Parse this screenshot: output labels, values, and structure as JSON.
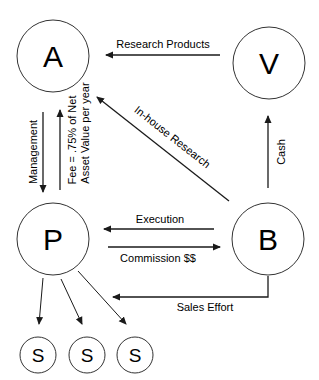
{
  "diagram": {
    "nodes": [
      {
        "id": "A",
        "label": "A"
      },
      {
        "id": "V",
        "label": "V"
      },
      {
        "id": "P",
        "label": "P"
      },
      {
        "id": "B",
        "label": "B"
      },
      {
        "id": "S1",
        "label": "S"
      },
      {
        "id": "S2",
        "label": "S"
      },
      {
        "id": "S3",
        "label": "S"
      }
    ],
    "edges": [
      {
        "from": "V",
        "to": "A",
        "label": "Research Products"
      },
      {
        "from": "A",
        "to": "P",
        "label": "Management"
      },
      {
        "from": "P",
        "to": "A",
        "label_line1": "Fee = .75% of Net",
        "label_line2": "Asset Value per year"
      },
      {
        "from": "B",
        "to": "A",
        "label": "In-house Research"
      },
      {
        "from": "B",
        "to": "V",
        "label": "Cash"
      },
      {
        "from": "B",
        "to": "P",
        "label": "Execution"
      },
      {
        "from": "P",
        "to": "B",
        "label": "Commission $$"
      },
      {
        "from": "B",
        "to": "P",
        "label": "Sales Effort"
      },
      {
        "from": "P",
        "to": "S1",
        "label": ""
      },
      {
        "from": "P",
        "to": "S2",
        "label": ""
      },
      {
        "from": "P",
        "to": "S3",
        "label": ""
      }
    ]
  }
}
